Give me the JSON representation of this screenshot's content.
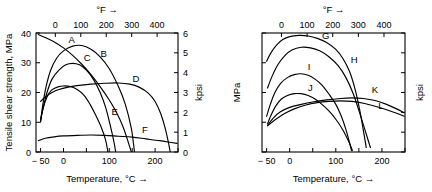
{
  "chart_data": [
    {
      "type": "line",
      "panel": "left",
      "title": "",
      "xlabel": "Temperature, °C →",
      "ylabel": "Tensile shear strength, MPa",
      "top_axis_label": "°F →",
      "right_axis_label": "kpsi",
      "xlim": [
        -60,
        250
      ],
      "ylim": [
        0,
        40
      ],
      "xticks": [
        -50,
        0,
        50,
        100,
        150,
        200,
        250
      ],
      "xticklabels": [
        "− 50",
        "0",
        "",
        "100",
        "",
        "200",
        ""
      ],
      "yticks": [
        0,
        10,
        20,
        30,
        40
      ],
      "yticklabels": [
        "0",
        "10",
        "20",
        "30",
        "40"
      ],
      "top_ticks": [
        -100,
        0,
        100,
        200,
        300,
        400,
        500
      ],
      "top_ticklabels": [
        "− 100",
        "0",
        "100",
        "200",
        "300",
        "400",
        "500"
      ],
      "right_ticks": [
        0,
        1,
        2,
        3,
        4,
        5,
        6
      ],
      "right_ticklabels": [
        "0",
        "1",
        "2",
        "3",
        "4",
        "5",
        "6"
      ],
      "grid": false,
      "legend": "inline-curve-labels",
      "series": [
        {
          "name": "A",
          "label_x": 18,
          "label_y": 36.5,
          "points": [
            [
              -55,
              39.5
            ],
            [
              -40,
              38.5
            ],
            [
              -20,
              37.0
            ],
            [
              0,
              35.0
            ],
            [
              20,
              32.5
            ],
            [
              40,
              29.5
            ],
            [
              60,
              26.0
            ],
            [
              80,
              22.0
            ],
            [
              100,
              17.5
            ],
            [
              115,
              13.5
            ],
            [
              130,
              8.5
            ],
            [
              142,
              3.0
            ],
            [
              148,
              0.0
            ]
          ]
        },
        {
          "name": "B",
          "label_x": 88,
          "label_y": 32.0,
          "points": [
            [
              -50,
              10.0
            ],
            [
              -45,
              16.0
            ],
            [
              -38,
              22.0
            ],
            [
              -28,
              27.5
            ],
            [
              -15,
              31.5
            ],
            [
              0,
              34.0
            ],
            [
              20,
              35.6
            ],
            [
              40,
              35.8
            ],
            [
              60,
              34.5
            ],
            [
              80,
              32.0
            ],
            [
              100,
              28.0
            ],
            [
              120,
              22.0
            ],
            [
              135,
              16.0
            ],
            [
              148,
              8.0
            ],
            [
              155,
              0.0
            ]
          ]
        },
        {
          "name": "C",
          "label_x": 52,
          "label_y": 30.5,
          "points": [
            [
              -50,
              10.5
            ],
            [
              -44,
              15.0
            ],
            [
              -36,
              20.0
            ],
            [
              -25,
              24.5
            ],
            [
              -10,
              27.5
            ],
            [
              5,
              29.3
            ],
            [
              20,
              29.8
            ],
            [
              35,
              29.3
            ],
            [
              50,
              27.5
            ],
            [
              65,
              24.5
            ],
            [
              80,
              20.0
            ],
            [
              92,
              15.0
            ],
            [
              102,
              9.0
            ],
            [
              110,
              3.5
            ],
            [
              114,
              0.0
            ]
          ]
        },
        {
          "name": "D",
          "label_x": 158,
          "label_y": 23.5,
          "points": [
            [
              -50,
              17.0
            ],
            [
              -40,
              18.5
            ],
            [
              -25,
              20.0
            ],
            [
              -10,
              21.0
            ],
            [
              10,
              21.8
            ],
            [
              30,
              22.3
            ],
            [
              60,
              22.8
            ],
            [
              90,
              23.1
            ],
            [
              120,
              23.2
            ],
            [
              145,
              22.8
            ],
            [
              165,
              21.8
            ],
            [
              185,
              19.8
            ],
            [
              200,
              17.0
            ],
            [
              212,
              13.0
            ],
            [
              222,
              8.0
            ],
            [
              230,
              2.5
            ],
            [
              233,
              0.0
            ]
          ]
        },
        {
          "name": "E",
          "label_x": 112,
          "label_y": 12.5,
          "points": [
            [
              -50,
              11.0
            ],
            [
              -44,
              15.0
            ],
            [
              -36,
              18.5
            ],
            [
              -26,
              20.8
            ],
            [
              -12,
              21.9
            ],
            [
              0,
              22.2
            ],
            [
              15,
              22.0
            ],
            [
              30,
              21.0
            ],
            [
              45,
              19.0
            ],
            [
              58,
              16.0
            ],
            [
              70,
              12.5
            ],
            [
              82,
              8.5
            ],
            [
              92,
              4.0
            ],
            [
              97,
              0.0
            ]
          ]
        },
        {
          "name": "F",
          "label_x": 178,
          "label_y": 6.5,
          "points": [
            [
              -55,
              3.8
            ],
            [
              -40,
              4.6
            ],
            [
              -20,
              5.1
            ],
            [
              0,
              5.4
            ],
            [
              30,
              5.6
            ],
            [
              60,
              5.7
            ],
            [
              90,
              5.6
            ],
            [
              120,
              5.3
            ],
            [
              150,
              5.0
            ],
            [
              180,
              4.4
            ],
            [
              210,
              3.8
            ],
            [
              235,
              3.2
            ],
            [
              248,
              2.9
            ]
          ]
        }
      ]
    },
    {
      "type": "line",
      "panel": "right",
      "title": "",
      "xlabel": "Temperature, °C →",
      "ylabel": "MPa",
      "top_axis_label": "°F →",
      "right_axis_label": "kpsi",
      "xlim": [
        -60,
        250
      ],
      "ylim": [
        0,
        40
      ],
      "xticks": [
        -50,
        0,
        50,
        100,
        150,
        200,
        250
      ],
      "xticklabels": [
        "− 50",
        "0",
        "",
        "100",
        "",
        "200",
        ""
      ],
      "yticks": [
        0,
        10,
        20,
        30,
        40
      ],
      "yticklabels": [
        "",
        "",
        "",
        "",
        ""
      ],
      "top_ticks": [
        -100,
        0,
        100,
        200,
        300,
        400,
        500
      ],
      "top_ticklabels": [
        "− 100",
        "0",
        "100",
        "200",
        "300",
        "400",
        "500"
      ],
      "right_ticks": [
        0,
        1,
        2,
        3,
        4,
        5,
        6
      ],
      "right_ticklabels": [
        "",
        "",
        "",
        "",
        "",
        "",
        ""
      ],
      "grid": false,
      "legend": "inline-curve-labels",
      "series": [
        {
          "name": "G",
          "label_x": 78,
          "label_y": 38.0,
          "points": [
            [
              -50,
              30.5
            ],
            [
              -40,
              33.5
            ],
            [
              -28,
              36.0
            ],
            [
              -15,
              37.8
            ],
            [
              0,
              38.8
            ],
            [
              20,
              39.2
            ],
            [
              40,
              39.0
            ],
            [
              60,
              38.2
            ],
            [
              80,
              36.8
            ],
            [
              100,
              34.5
            ],
            [
              115,
              31.5
            ],
            [
              130,
              27.0
            ],
            [
              142,
              21.0
            ],
            [
              152,
              14.0
            ],
            [
              160,
              7.0
            ],
            [
              166,
              1.5
            ]
          ]
        },
        {
          "name": "H",
          "label_x": 140,
          "label_y": 30.0,
          "points": [
            [
              -48,
              21.5
            ],
            [
              -38,
              25.5
            ],
            [
              -25,
              29.5
            ],
            [
              -10,
              32.5
            ],
            [
              5,
              34.3
            ],
            [
              25,
              35.2
            ],
            [
              45,
              35.0
            ],
            [
              65,
              34.0
            ],
            [
              85,
              32.0
            ],
            [
              105,
              29.0
            ],
            [
              122,
              25.0
            ],
            [
              138,
              19.5
            ],
            [
              152,
              13.0
            ],
            [
              165,
              6.5
            ],
            [
              175,
              1.5
            ]
          ]
        },
        {
          "name": "I",
          "label_x": 42,
          "label_y": 27.5,
          "points": [
            [
              -50,
              12.0
            ],
            [
              -42,
              16.0
            ],
            [
              -32,
              20.0
            ],
            [
              -20,
              23.0
            ],
            [
              -5,
              25.0
            ],
            [
              10,
              26.0
            ],
            [
              25,
              26.3
            ],
            [
              40,
              25.8
            ],
            [
              55,
              24.5
            ],
            [
              70,
              22.5
            ],
            [
              85,
              19.5
            ],
            [
              100,
              16.0
            ],
            [
              112,
              12.0
            ],
            [
              122,
              7.5
            ],
            [
              130,
              3.0
            ],
            [
              134,
              0.5
            ]
          ]
        },
        {
          "name": "J",
          "label_x": 45,
          "label_y": 20.5,
          "points": [
            [
              -48,
              9.5
            ],
            [
              -40,
              12.5
            ],
            [
              -30,
              15.5
            ],
            [
              -18,
              17.8
            ],
            [
              -5,
              19.0
            ],
            [
              10,
              19.6
            ],
            [
              25,
              19.6
            ],
            [
              40,
              19.0
            ],
            [
              55,
              17.8
            ],
            [
              70,
              16.0
            ],
            [
              85,
              13.8
            ],
            [
              100,
              11.0
            ],
            [
              115,
              7.5
            ],
            [
              128,
              3.5
            ],
            [
              136,
              0.5
            ]
          ]
        },
        {
          "name": "K",
          "label_x": 185,
          "label_y": 20.0,
          "points": [
            [
              -48,
              9.0
            ],
            [
              -35,
              11.5
            ],
            [
              -20,
              13.5
            ],
            [
              0,
              15.0
            ],
            [
              25,
              16.0
            ],
            [
              50,
              16.8
            ],
            [
              80,
              17.5
            ],
            [
              110,
              18.0
            ],
            [
              135,
              18.2
            ],
            [
              160,
              18.0
            ],
            [
              185,
              17.3
            ],
            [
              210,
              16.0
            ],
            [
              232,
              14.5
            ],
            [
              248,
              13.2
            ]
          ]
        },
        {
          "name": "L",
          "label_x": 198,
          "label_y": 14.5,
          "points": [
            [
              -48,
              8.8
            ],
            [
              -30,
              11.0
            ],
            [
              -10,
              13.0
            ],
            [
              10,
              14.5
            ],
            [
              35,
              15.8
            ],
            [
              60,
              16.6
            ],
            [
              85,
              17.0
            ],
            [
              110,
              17.2
            ],
            [
              135,
              17.0
            ],
            [
              160,
              16.4
            ],
            [
              185,
              15.4
            ],
            [
              210,
              14.2
            ],
            [
              232,
              13.0
            ],
            [
              248,
              12.0
            ]
          ]
        }
      ]
    }
  ]
}
